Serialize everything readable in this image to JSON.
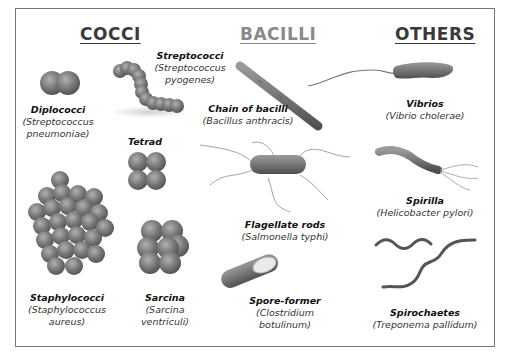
{
  "colors": {
    "heading_cocci": "#3a3a3a",
    "heading_bacilli": "#8a8a8a",
    "heading_others": "#3a3a3a",
    "cell": "#6e6e6e",
    "cell_highlight": "#a8a8a8",
    "flagella": "#8f8f8f",
    "frame": "#777777"
  },
  "sections": [
    {
      "heading": "COCCI"
    },
    {
      "heading": "BACILLI"
    },
    {
      "heading": "OTHERS"
    }
  ],
  "cocci": [
    {
      "name": "Diplococci",
      "species_line1": "(Streptococcus",
      "species_line2": "pneumoniae)"
    },
    {
      "name": "Streptococci",
      "species_line1": "(Streptococcus",
      "species_line2": "pyogenes)"
    },
    {
      "name": "Tetrad"
    },
    {
      "name": "Staphylococci",
      "species_line1": "(Staphylococcus",
      "species_line2": "aureus)"
    },
    {
      "name": "Sarcina",
      "species_line1": "(Sarcina",
      "species_line2": "ventriculi)"
    }
  ],
  "bacilli": [
    {
      "name": "Chain of bacilli",
      "species_line1": "(Bacillus anthracis)"
    },
    {
      "name": "Flagellate rods",
      "species_line1": "(Salmonella typhi)"
    },
    {
      "name": "Spore-former",
      "species_line1": "(Clostridium",
      "species_line2": "botulinum)"
    }
  ],
  "others": [
    {
      "name": "Vibrios",
      "species_line1": "(Vibrio cholerae)"
    },
    {
      "name": "Spirilla",
      "species_line1": "(Helicobacter pylori)"
    },
    {
      "name": "Spirochaetes",
      "species_line1": "(Treponema pallidum)"
    }
  ]
}
